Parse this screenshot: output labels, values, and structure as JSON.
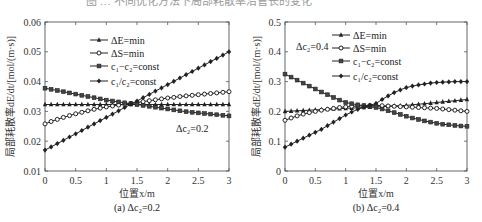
{
  "header": {
    "partial_title": "图 … 不同优化方法下局部耗散率沿管长的变化"
  },
  "chart_data": [
    {
      "type": "line",
      "id": "a",
      "caption": "(a)  Δc₂=0.2",
      "annotation": "Δc₂=0.2",
      "xlabel": "位置x/m",
      "ylabel": "局部耗散率dE/dt/[mol/(m·s)]",
      "xlim": [
        0,
        3
      ],
      "ylim": [
        0.01,
        0.06
      ],
      "xticks": [
        0,
        0.5,
        1,
        1.5,
        2,
        2.5,
        3
      ],
      "xtick_labels": [
        "0",
        "0.5",
        "1",
        "1.5",
        "2",
        "2.5",
        "3"
      ],
      "yticks": [
        0.01,
        0.02,
        0.03,
        0.04,
        0.05,
        0.06
      ],
      "ytick_labels": [
        "0.01",
        "0.02",
        "0.03",
        "0.04",
        "0.05",
        "0.06"
      ],
      "grid": false,
      "legend_position": "upper left",
      "x": [
        0,
        0.1,
        0.2,
        0.3,
        0.4,
        0.5,
        0.6,
        0.7,
        0.8,
        0.9,
        1.0,
        1.1,
        1.2,
        1.3,
        1.4,
        1.5,
        1.6,
        1.7,
        1.8,
        1.9,
        2.0,
        2.1,
        2.2,
        2.3,
        2.4,
        2.5,
        2.6,
        2.7,
        2.8,
        2.9,
        3.0
      ],
      "series": [
        {
          "name": "ΔE=min",
          "marker": "triangle",
          "values": [
            0.0323,
            0.0323,
            0.0323,
            0.0323,
            0.0323,
            0.0323,
            0.0323,
            0.0323,
            0.0323,
            0.0323,
            0.0323,
            0.0323,
            0.0323,
            0.0323,
            0.0323,
            0.0323,
            0.0323,
            0.0323,
            0.0323,
            0.0323,
            0.0323,
            0.0323,
            0.0323,
            0.0323,
            0.0323,
            0.0323,
            0.0323,
            0.0323,
            0.0323,
            0.0323,
            0.0323
          ]
        },
        {
          "name": "ΔS=min",
          "marker": "circle",
          "values": [
            0.0258,
            0.0266,
            0.0273,
            0.028,
            0.0286,
            0.0292,
            0.0297,
            0.0302,
            0.0307,
            0.0311,
            0.0315,
            0.0318,
            0.0321,
            0.0324,
            0.0327,
            0.033,
            0.0333,
            0.0336,
            0.0339,
            0.0342,
            0.0345,
            0.0347,
            0.035,
            0.0352,
            0.0354,
            0.0356,
            0.0358,
            0.036,
            0.0362,
            0.0364,
            0.0366
          ]
        },
        {
          "name": "c₁−c₂=const",
          "marker": "square",
          "values": [
            0.0378,
            0.0374,
            0.037,
            0.0366,
            0.0362,
            0.0358,
            0.0354,
            0.035,
            0.0346,
            0.0342,
            0.0338,
            0.0335,
            0.0332,
            0.0329,
            0.0326,
            0.0323,
            0.032,
            0.0317,
            0.0314,
            0.0311,
            0.0308,
            0.0305,
            0.0302,
            0.0299,
            0.0297,
            0.0295,
            0.0293,
            0.0291,
            0.0289,
            0.0287,
            0.0285
          ]
        },
        {
          "name": "c₁/c₂=const",
          "marker": "diamond",
          "values": [
            0.017,
            0.0181,
            0.0192,
            0.0203,
            0.0214,
            0.0225,
            0.0236,
            0.0247,
            0.0258,
            0.0269,
            0.028,
            0.0291,
            0.0302,
            0.0313,
            0.0324,
            0.0335,
            0.0346,
            0.0357,
            0.0368,
            0.0379,
            0.039,
            0.0401,
            0.0412,
            0.0423,
            0.0434,
            0.0445,
            0.0456,
            0.0467,
            0.0478,
            0.0489,
            0.05
          ]
        }
      ]
    },
    {
      "type": "line",
      "id": "b",
      "caption": "(b)  Δc₂=0.4",
      "annotation": "Δc₂=0.4",
      "xlabel": "位置x/m",
      "ylabel": "局部耗散率dE/dt/[mol/(m·s)]",
      "xlim": [
        0,
        3
      ],
      "ylim": [
        0,
        0.5
      ],
      "xticks": [
        0,
        0.5,
        1,
        1.5,
        2,
        2.5,
        3
      ],
      "xtick_labels": [
        "0",
        "0.5",
        "1",
        "1.5",
        "2",
        "2.5",
        "3"
      ],
      "yticks": [
        0,
        0.1,
        0.2,
        0.3,
        0.4,
        0.5
      ],
      "ytick_labels": [
        "0",
        "0.1",
        "0.2",
        "0.3",
        "0.4",
        "0.5"
      ],
      "grid": false,
      "legend_position": "upper right",
      "x": [
        0,
        0.1,
        0.2,
        0.3,
        0.4,
        0.5,
        0.6,
        0.7,
        0.8,
        0.9,
        1.0,
        1.1,
        1.2,
        1.3,
        1.4,
        1.5,
        1.6,
        1.7,
        1.8,
        1.9,
        2.0,
        2.1,
        2.2,
        2.3,
        2.4,
        2.5,
        2.6,
        2.7,
        2.8,
        2.9,
        3.0
      ],
      "series": [
        {
          "name": "ΔE=min",
          "marker": "triangle",
          "values": [
            0.2,
            0.201,
            0.202,
            0.203,
            0.204,
            0.205,
            0.206,
            0.207,
            0.208,
            0.209,
            0.21,
            0.211,
            0.212,
            0.213,
            0.214,
            0.215,
            0.216,
            0.217,
            0.218,
            0.219,
            0.22,
            0.222,
            0.224,
            0.226,
            0.228,
            0.23,
            0.232,
            0.234,
            0.236,
            0.238,
            0.24
          ]
        },
        {
          "name": "ΔS=min",
          "marker": "circle",
          "values": [
            0.17,
            0.178,
            0.185,
            0.191,
            0.196,
            0.2,
            0.204,
            0.207,
            0.21,
            0.213,
            0.215,
            0.217,
            0.218,
            0.219,
            0.22,
            0.22,
            0.219,
            0.218,
            0.217,
            0.216,
            0.215,
            0.214,
            0.213,
            0.212,
            0.211,
            0.21,
            0.208,
            0.206,
            0.204,
            0.202,
            0.2
          ]
        },
        {
          "name": "c₁−c₂=const",
          "marker": "square",
          "values": [
            0.325,
            0.315,
            0.305,
            0.295,
            0.285,
            0.275,
            0.265,
            0.256,
            0.247,
            0.238,
            0.23,
            0.226,
            0.222,
            0.219,
            0.216,
            0.213,
            0.208,
            0.202,
            0.196,
            0.19,
            0.184,
            0.178,
            0.173,
            0.168,
            0.164,
            0.16,
            0.157,
            0.155,
            0.153,
            0.151,
            0.15
          ]
        },
        {
          "name": "c₁/c₂=const",
          "marker": "diamond",
          "values": [
            0.08,
            0.09,
            0.1,
            0.11,
            0.12,
            0.13,
            0.14,
            0.152,
            0.164,
            0.176,
            0.188,
            0.198,
            0.207,
            0.214,
            0.22,
            0.227,
            0.24,
            0.252,
            0.263,
            0.272,
            0.28,
            0.285,
            0.289,
            0.292,
            0.295,
            0.297,
            0.298,
            0.299,
            0.3,
            0.3,
            0.3
          ]
        }
      ]
    }
  ]
}
